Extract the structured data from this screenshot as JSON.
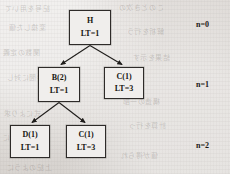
{
  "diagram": {
    "type": "tree",
    "title": "",
    "nodes": [
      {
        "id": "root",
        "label": "H",
        "sublabel": "LT=1",
        "level": 0,
        "x": 69,
        "y": 10,
        "w": 42,
        "h": 35
      },
      {
        "id": "b2",
        "label": "B(2)",
        "sublabel": "LT=1",
        "level": 1,
        "x": 38,
        "y": 67,
        "w": 42,
        "h": 35
      },
      {
        "id": "c1-level1",
        "label": "C(1)",
        "sublabel": "LT=3",
        "level": 1,
        "x": 104,
        "y": 67,
        "w": 40,
        "h": 32
      },
      {
        "id": "d1",
        "label": "D(1)",
        "sublabel": "LT=1",
        "level": 2,
        "x": 10,
        "y": 125,
        "w": 40,
        "h": 33
      },
      {
        "id": "c1-level2",
        "label": "C(1)",
        "sublabel": "LT=3",
        "level": 2,
        "x": 66,
        "y": 125,
        "w": 40,
        "h": 33
      }
    ],
    "edges": [
      {
        "from": "root",
        "to": "b2"
      },
      {
        "from": "root",
        "to": "c1-level1"
      },
      {
        "from": "b2",
        "to": "d1"
      },
      {
        "from": "b2",
        "to": "c1-level2"
      }
    ],
    "level_labels": [
      {
        "text": "n=0",
        "x": 196,
        "y": 20
      },
      {
        "text": "n=1",
        "x": 196,
        "y": 80
      },
      {
        "text": "n=2",
        "x": 196,
        "y": 141
      }
    ],
    "colors": {
      "page_background": "#dcd8d5",
      "node_fill": "#f0eeec",
      "node_border": "#2e2b29",
      "text": "#16150f",
      "edge": "#1f1d1b"
    },
    "background_bleed": [
      {
        "text": "記号を用いて",
        "x": 4,
        "y": 3
      },
      {
        "text": "このとき次の",
        "x": 118,
        "y": 2
      },
      {
        "text": "変換した値",
        "x": 8,
        "y": 22
      },
      {
        "text": "解析を行う",
        "x": 126,
        "y": 26
      },
      {
        "text": "関数の定義",
        "x": 2,
        "y": 47
      },
      {
        "text": "結果を示す",
        "x": 132,
        "y": 52
      },
      {
        "text": "時間に対し",
        "x": 6,
        "y": 72
      },
      {
        "text": "構造の一部",
        "x": 122,
        "y": 96
      },
      {
        "text": "式により求",
        "x": 3,
        "y": 108
      },
      {
        "text": "計算を行っ",
        "x": 128,
        "y": 120
      },
      {
        "text": "以下のように",
        "x": 2,
        "y": 132
      },
      {
        "text": "値が得られ",
        "x": 120,
        "y": 150
      },
      {
        "text": "上記のように",
        "x": 6,
        "y": 162
      }
    ]
  }
}
